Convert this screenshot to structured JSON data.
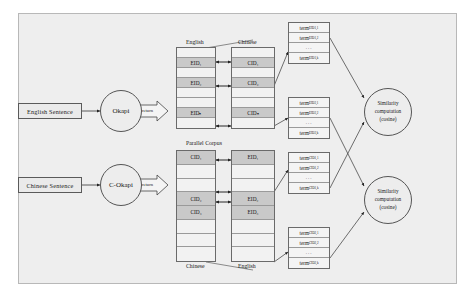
{
  "diagram": {
    "panel": {
      "background": "#eeeeee",
      "border": "#b8b8b8"
    },
    "inputs": [
      {
        "id": "english-sentence",
        "label": "English Sentence"
      },
      {
        "id": "chinese-sentence",
        "label": "Chinese Sentence"
      }
    ],
    "engines": [
      {
        "id": "okapi",
        "label": "Okapi",
        "return_label": "return"
      },
      {
        "id": "c-okapi",
        "label": "C-Okapi",
        "return_label": "return"
      }
    ],
    "corpus_label": "Parallel Corpus",
    "column_headers": {
      "top_left": "English",
      "top_right": "Chinese",
      "bottom_left": "Chinese",
      "bottom_right": "English"
    },
    "id_tables": [
      {
        "id": "top-left-eid-column",
        "language": "English",
        "cells": [
          {
            "text": "",
            "filled": false
          },
          {
            "text": "EID₁",
            "filled": true
          },
          {
            "text": "",
            "filled": false
          },
          {
            "text": "EID₂",
            "filled": true
          },
          {
            "text": "",
            "filled": false
          },
          {
            "text": "",
            "filled": false
          },
          {
            "text": "EIDₙ",
            "filled": true
          },
          {
            "text": "",
            "filled": false
          }
        ]
      },
      {
        "id": "top-right-cid-column",
        "language": "Chinese",
        "cells": [
          {
            "text": "",
            "filled": false
          },
          {
            "text": "CID₁",
            "filled": true
          },
          {
            "text": "",
            "filled": false
          },
          {
            "text": "CID₂",
            "filled": true
          },
          {
            "text": "",
            "filled": false
          },
          {
            "text": "",
            "filled": false
          },
          {
            "text": "CIDₙ",
            "filled": true
          },
          {
            "text": "",
            "filled": false
          }
        ]
      },
      {
        "id": "bottom-left-cid-column",
        "language": "Chinese",
        "cells": [
          {
            "text": "CID₁",
            "filled": true
          },
          {
            "text": "",
            "filled": false
          },
          {
            "text": "",
            "filled": false
          },
          {
            "text": "CID₂",
            "filled": true
          },
          {
            "text": "CID₃",
            "filled": true
          },
          {
            "text": "",
            "filled": false
          },
          {
            "text": "",
            "filled": false
          },
          {
            "text": "",
            "filled": false
          }
        ]
      },
      {
        "id": "bottom-right-eid-column",
        "language": "English",
        "cells": [
          {
            "text": "EID₁",
            "filled": true
          },
          {
            "text": "",
            "filled": false
          },
          {
            "text": "",
            "filled": false
          },
          {
            "text": "EID₂",
            "filled": true
          },
          {
            "text": "EID₃",
            "filled": true
          },
          {
            "text": "",
            "filled": false
          },
          {
            "text": "",
            "filled": false
          },
          {
            "text": "",
            "filled": false
          }
        ]
      }
    ],
    "term_groups": [
      {
        "id": "term-group-eid1",
        "rows": [
          "term",
          "term",
          "...",
          "term"
        ],
        "subs": [
          "EID1,1",
          "EID1,2",
          "",
          "EID1,k"
        ]
      },
      {
        "id": "term-group-eid2",
        "rows": [
          "term",
          "term",
          "...",
          "term"
        ],
        "subs": [
          "EID2,1",
          "EID2,2",
          "",
          "EID2,k"
        ]
      },
      {
        "id": "term-group-cid1",
        "rows": [
          "term",
          "term",
          "...",
          "term"
        ],
        "subs": [
          "CID1,1",
          "CID1,2",
          "",
          "CID1,k"
        ]
      },
      {
        "id": "term-group-cid2",
        "rows": [
          "term",
          "term",
          "...",
          "term"
        ],
        "subs": [
          "CID2,1",
          "CID2,2",
          "",
          "CID2,k"
        ]
      }
    ],
    "similarity_nodes": [
      {
        "id": "similarity-top",
        "line1": "Similarity",
        "line2": "computation",
        "line3": "(cosine)"
      },
      {
        "id": "similarity-bottom",
        "line1": "Similarity",
        "line2": "computation",
        "line3": "(cosine)"
      }
    ]
  }
}
